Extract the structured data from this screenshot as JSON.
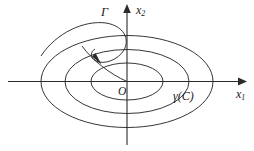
{
  "figure": {
    "background_color": "#ffffff",
    "stroke_color": "#2b2b2b",
    "width": 254,
    "height": 151
  },
  "axes": {
    "horizontal": {
      "name": "x1-axis",
      "label": "x",
      "subscript": "1",
      "y": 81.5,
      "x_start": 8,
      "x_end": 243,
      "arrow": "right"
    },
    "vertical": {
      "name": "x2-axis",
      "label": "x",
      "subscript": "2",
      "x": 127,
      "y_start": 8,
      "y_end": 145,
      "arrow": "up"
    },
    "origin": {
      "label": "O",
      "x": 127,
      "y": 81.5
    }
  },
  "orbits": [
    {
      "name": "inner-orbit",
      "rx": 36,
      "ry": 18.5,
      "cx": 127,
      "cy": 81.5
    },
    {
      "name": "middle-orbit",
      "rx": 62,
      "ry": 32,
      "cx": 127,
      "cy": 81.5
    },
    {
      "name": "outer-orbit",
      "rx": 86,
      "ry": 46,
      "cx": 127,
      "cy": 81.5
    }
  ],
  "trajectory": {
    "name": "gamma-trajectory",
    "label": "Γ",
    "description": "spiral curve approaching the origin from the upper left",
    "arrow_tip": {
      "x": 99,
      "y": 63
    }
  },
  "labels": {
    "gamma_curve": "Γ",
    "gamma_of_c": "γ(C)",
    "origin": "O",
    "x1_base": "x",
    "x1_sub": "1",
    "x2_base": "x",
    "x2_sub": "2"
  }
}
